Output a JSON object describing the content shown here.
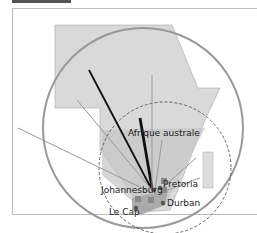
{
  "diagram": {
    "labels": {
      "region": "Afrique australe",
      "city1": "Johannesburg",
      "city2": "Pretoria",
      "city3": "Durban",
      "city4": "Le Cap"
    },
    "colors": {
      "continent": "#d9d9d9",
      "region_cone": "#c8c8c8",
      "circle_outer": "#999999",
      "circle_dashed": "#444444",
      "arrow_dark": "#111111",
      "arrow_light": "#a0a0a0"
    }
  }
}
